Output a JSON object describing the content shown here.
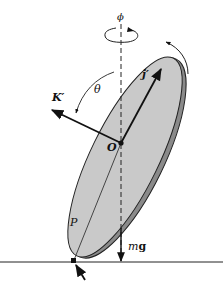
{
  "diagram": {
    "type": "rigid-body free-body diagram",
    "labels": {
      "phi": "ϕ",
      "theta": "θ",
      "k_prime": "K′",
      "j_prime": "j′",
      "origin": "O",
      "contact_point": "P",
      "weight_m": "m",
      "weight_g": "g",
      "contact_force_F": "F",
      "contact_force_sub": "P"
    },
    "colors": {
      "disk_face": "#c9c9c9",
      "disk_rim": "#8a8a8a",
      "ink": "#111111",
      "background": "#ffffff"
    }
  }
}
